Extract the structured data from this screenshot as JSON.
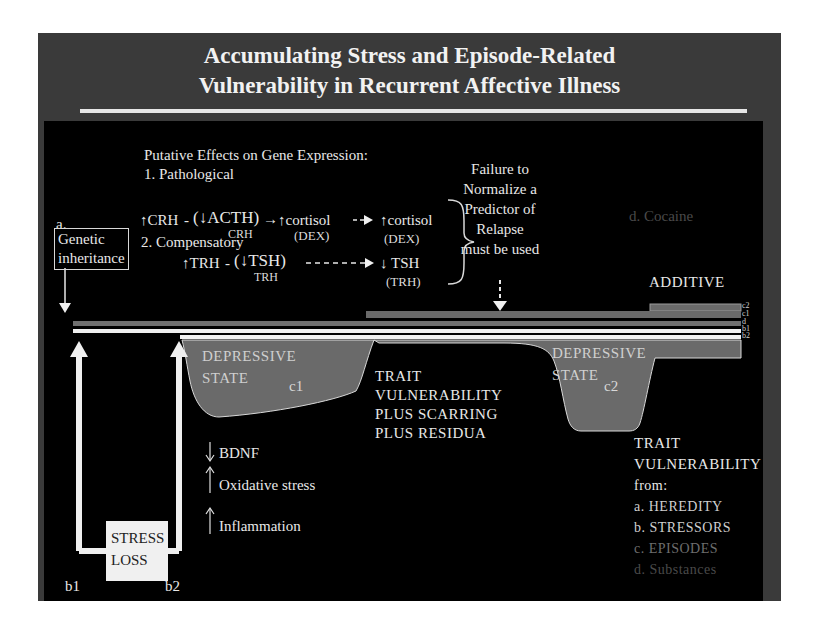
{
  "slide": {
    "title_line1": "Accumulating Stress and Episode-Related",
    "title_line2": "Vulnerability in Recurrent Affective Illness",
    "colors": {
      "frame": "#3a3a3a",
      "panel": "#000000",
      "band_grey": "#6a6a6a",
      "white": "#f0f0f0"
    }
  },
  "gene_expression": {
    "heading": "Putative Effects on Gene Expression:",
    "pathological_label": "1. Pathological",
    "pathological_chain": {
      "crh": "↑CRH",
      "sep": "-",
      "acth": "(↓ACTH)",
      "acth_sub": "CRH",
      "arrow": "→",
      "cortisol1": "↑cortisol",
      "cortisol1_sub": "(DEX)",
      "cortisol2": "↑cortisol",
      "cortisol2_sub": "(DEX)"
    },
    "compensatory_label": "2. Compensatory",
    "compensatory_chain": {
      "trh": "↑TRH",
      "sep": "-",
      "tsh": "(↓TSH)",
      "tsh_sub": "TRH",
      "tsh2": "↓ TSH",
      "tsh2_sub": "(TRH)"
    }
  },
  "failure_note": {
    "lines": [
      "Failure to",
      "Normalize a",
      "Predictor of",
      "Relapse",
      "must be used"
    ]
  },
  "cocaine_label": "d. Cocaine",
  "additive_label": "ADDITIVE",
  "genetic": {
    "letter": "a.",
    "line1": "Genetic",
    "line2": "inheritance"
  },
  "bar_labels": [
    "c2",
    "c1",
    "d",
    "b1",
    "b2"
  ],
  "episodes": {
    "c1": {
      "line1": "DEPRESSIVE",
      "line2": "STATE",
      "tag": "c1"
    },
    "c2": {
      "line1": "DEPRESSIVE",
      "line2": "STATE",
      "tag": "c2"
    }
  },
  "trait_middle": [
    "TRAIT",
    "VULNERABILITY",
    "PLUS SCARRING",
    "PLUS RESIDUA"
  ],
  "trait_right": {
    "title1": "TRAIT",
    "title2": "VULNERABILITY",
    "from": "from:",
    "items": [
      "a. HEREDITY",
      "b. STRESSORS",
      "c. EPISODES",
      "d. Substances"
    ]
  },
  "stress_box": {
    "line1": "STRESS",
    "line2": "LOSS"
  },
  "b_labels": {
    "b1": "b1",
    "b2": "b2"
  },
  "biomarkers": [
    {
      "dir": "↓",
      "label": "BDNF"
    },
    {
      "dir": "↑",
      "label": "Oxidative stress"
    },
    {
      "dir": "↑",
      "label": "Inflammation"
    }
  ]
}
